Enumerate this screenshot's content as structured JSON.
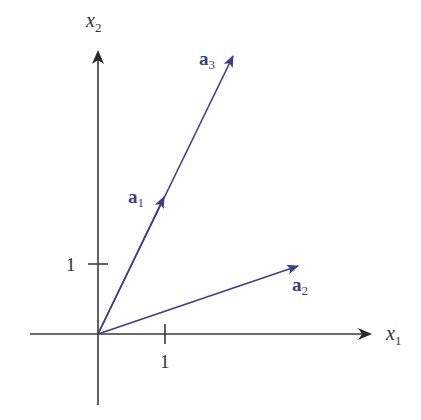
{
  "diagram": {
    "type": "vector-plot",
    "colors": {
      "axis": "#3a3a3a",
      "vector": "#3a3f8a",
      "background": "#ffffff"
    },
    "axes": {
      "x_label": "x",
      "x_sub": "1",
      "y_label": "x",
      "y_sub": "2",
      "x_tick_label": "1",
      "y_tick_label": "1"
    },
    "vectors": [
      {
        "name": "a",
        "sub": "1",
        "x": 1,
        "y": 2,
        "arrow": "midpoint"
      },
      {
        "name": "a",
        "sub": "2",
        "x": 3,
        "y": 1,
        "arrow": "tip"
      },
      {
        "name": "a",
        "sub": "3",
        "x": 2,
        "y": 4,
        "arrow": "tip"
      }
    ]
  }
}
